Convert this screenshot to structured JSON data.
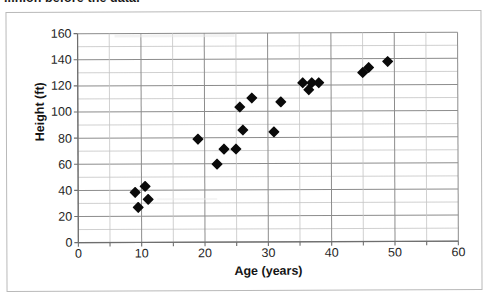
{
  "page": {
    "clipped_heading": "...hion before the data."
  },
  "chart_data": {
    "type": "scatter",
    "title": "",
    "xlabel": "Age (years)",
    "ylabel": "Height (ft)",
    "xlim": [
      0,
      60
    ],
    "ylim": [
      0,
      160
    ],
    "xticks": [
      0,
      10,
      20,
      30,
      40,
      50,
      60
    ],
    "yticks": [
      0,
      20,
      40,
      60,
      80,
      100,
      120,
      140,
      160
    ],
    "xtick_labels": [
      "0",
      "10",
      "20",
      "30",
      "40",
      "50",
      "60"
    ],
    "ytick_labels": [
      "0",
      "20",
      "40",
      "60",
      "80",
      "100",
      "120",
      "140",
      "160"
    ],
    "x_gridline_step": 5,
    "y_gridline_step": 10,
    "grid": true,
    "legend": false,
    "marker": "diamond",
    "marker_color": "#0a0a0a",
    "series": [
      {
        "name": "Tree data",
        "points": [
          {
            "x": 9.0,
            "y": 38
          },
          {
            "x": 9.5,
            "y": 27
          },
          {
            "x": 10.5,
            "y": 43
          },
          {
            "x": 11.0,
            "y": 33
          },
          {
            "x": 19.0,
            "y": 79
          },
          {
            "x": 22.0,
            "y": 60
          },
          {
            "x": 23.0,
            "y": 71
          },
          {
            "x": 25.0,
            "y": 71
          },
          {
            "x": 25.5,
            "y": 103
          },
          {
            "x": 26.0,
            "y": 86
          },
          {
            "x": 27.5,
            "y": 110
          },
          {
            "x": 31.0,
            "y": 84
          },
          {
            "x": 32.0,
            "y": 107
          },
          {
            "x": 35.5,
            "y": 122
          },
          {
            "x": 36.5,
            "y": 116
          },
          {
            "x": 37.0,
            "y": 122
          },
          {
            "x": 38.0,
            "y": 122
          },
          {
            "x": 45.0,
            "y": 129
          },
          {
            "x": 46.0,
            "y": 133
          },
          {
            "x": 49.0,
            "y": 138
          }
        ]
      }
    ]
  }
}
